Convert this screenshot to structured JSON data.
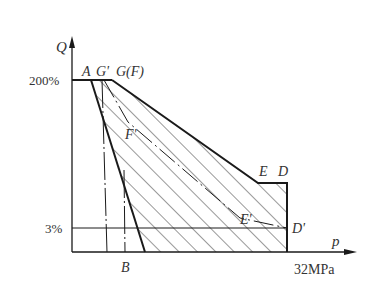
{
  "diagram": {
    "type": "pressure-flow characteristic (Q-p) diagram",
    "axes": {
      "y_label": "Q",
      "x_label": "p",
      "x_max_label": "32MPa",
      "y_ticks": [
        "200%",
        "3%"
      ]
    },
    "points": {
      "A": "A",
      "G_prime": "G'",
      "G_F": "G(F)",
      "F_prime": "F'",
      "E": "E",
      "D": "D",
      "E_prime": "E'",
      "D_prime": "D'",
      "B": "B"
    },
    "colors": {
      "line": "#1a1a1a",
      "hatch": "#333333",
      "background": "#ffffff"
    }
  }
}
